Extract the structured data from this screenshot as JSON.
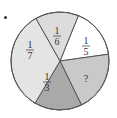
{
  "chart_data": {
    "type": "pie",
    "title": "",
    "slices": [
      {
        "label": "1/6",
        "numerator": "1",
        "denominator": "6",
        "value": 0.1667,
        "color": "#ffffff"
      },
      {
        "label": "1/5",
        "numerator": "1",
        "denominator": "5",
        "value": 0.2,
        "color": "#c9c9c9"
      },
      {
        "label": "?",
        "numerator": "?",
        "denominator": "",
        "value": null,
        "color": "#a9a9a9"
      },
      {
        "label": "1/3",
        "numerator": "1",
        "denominator": "3",
        "value": 0.3333,
        "color": "#e4e4e4"
      },
      {
        "label": "1/7",
        "numerator": "1",
        "denominator": "7",
        "value": 0.1429,
        "color": "#dcdcdc"
      }
    ],
    "legend": "none",
    "start_angle_deg": 22,
    "direction": "clockwise"
  },
  "labels": {
    "s1_num": "1",
    "s1_den": "6",
    "s2_num": "1",
    "s2_den": "5",
    "s3_q": "?",
    "s4_num": "1",
    "s4_den": "3",
    "s5_num": "1",
    "s5_den": "7"
  }
}
